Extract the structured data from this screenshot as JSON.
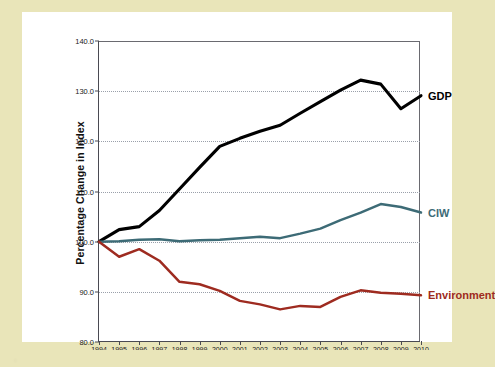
{
  "figure": {
    "background_color": "#e9e5b9",
    "panel_color": "#ffffff",
    "caption_blur_text": "  .                                                                                                                   "
  },
  "chart_data": {
    "type": "line",
    "title": "",
    "xlabel": "",
    "ylabel": "Percentage Change in Index",
    "ylim": [
      80.0,
      140.0
    ],
    "ytick_labels": [
      "80.0",
      "90.0",
      "100.0",
      "110.0",
      "120.0",
      "130.0",
      "140.0"
    ],
    "yticks": [
      80.0,
      90.0,
      100.0,
      110.0,
      120.0,
      130.0,
      140.0
    ],
    "grid": true,
    "grid_axis": "y",
    "legend_position": "right-inline",
    "categories": [
      "1994",
      "1995",
      "1996",
      "1997",
      "1998",
      "1999",
      "2000",
      "2001",
      "2002",
      "2003",
      "2004",
      "2005",
      "2006",
      "2007",
      "2008",
      "2009",
      "2010"
    ],
    "x": [
      1994,
      1995,
      1996,
      1997,
      1998,
      1999,
      2000,
      2001,
      2002,
      2003,
      2004,
      2005,
      2006,
      2007,
      2008,
      2009,
      2010
    ],
    "series": [
      {
        "name": "GDP",
        "color": "#000000",
        "values": [
          100.0,
          102.4,
          103.0,
          106.2,
          110.5,
          114.8,
          119.0,
          120.6,
          122.0,
          123.2,
          125.6,
          127.9,
          130.2,
          132.2,
          131.4,
          126.5,
          129.1
        ]
      },
      {
        "name": "CIW",
        "color": "#3d6b76",
        "values": [
          100.0,
          100.1,
          100.4,
          100.5,
          100.1,
          100.3,
          100.4,
          100.7,
          101.0,
          100.7,
          101.6,
          102.6,
          104.3,
          105.8,
          107.5,
          106.9,
          105.8
        ]
      },
      {
        "name": "Environment",
        "color": "#9e2b20",
        "values": [
          100.0,
          97.0,
          98.5,
          96.2,
          92.0,
          91.5,
          90.2,
          88.2,
          87.5,
          86.5,
          87.2,
          87.0,
          89.0,
          90.3,
          89.8,
          89.6,
          89.3
        ]
      }
    ]
  },
  "labels": {
    "gdp": "GDP",
    "ciw": "CIW",
    "environment": "Environment"
  }
}
